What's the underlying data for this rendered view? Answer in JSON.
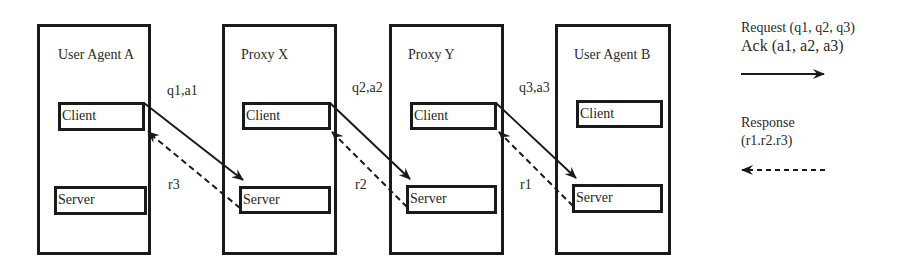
{
  "diagram": {
    "entities": [
      {
        "id": "ua-a",
        "title": "User Agent A",
        "client": "Client",
        "server": "Server"
      },
      {
        "id": "proxy-x",
        "title": "Proxy X",
        "client": "Client",
        "server": "Server"
      },
      {
        "id": "proxy-y",
        "title": "Proxy Y",
        "client": "Client",
        "server": "Server"
      },
      {
        "id": "ua-b",
        "title": "User Agent B",
        "client": "Client",
        "server": "Server"
      }
    ],
    "links": [
      {
        "request_label": "q1,a1",
        "response_label": "r3"
      },
      {
        "request_label": "q2,a2",
        "response_label": "r2"
      },
      {
        "request_label": "q3,a3",
        "response_label": "r1"
      }
    ],
    "legend": {
      "request_line1": "Request (q1, q2, q3)",
      "request_line2": "Ack (a1, a2, a3)",
      "request_arrow": "solid-arrow-right",
      "response_line1": "Response",
      "response_line2": "(r1.r2.r3)",
      "response_arrow": "dashed-arrow-left"
    },
    "colors": {
      "stroke": "#1a1a1a",
      "text": "#2a2a2a",
      "background": "#ffffff"
    }
  }
}
